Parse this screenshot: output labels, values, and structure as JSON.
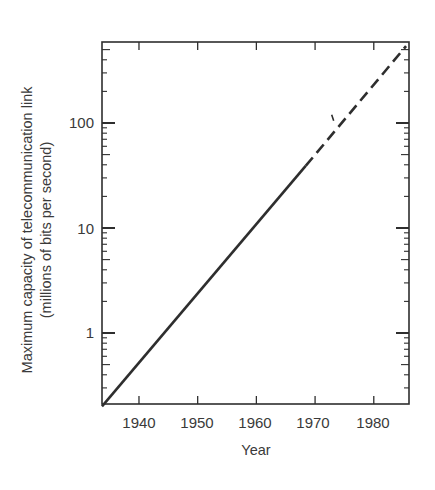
{
  "chart_data": {
    "type": "line",
    "title": "",
    "xlabel": "Year",
    "ylabel": "Maximum capacity of telecommunication link",
    "ylabel_line2": "(millions of bits per second)",
    "yscale": "log",
    "xlim": [
      1933.7,
      1986
    ],
    "ylim": [
      0.19,
      590
    ],
    "grid": false,
    "legend": null,
    "x_ticks": [
      1940,
      1950,
      1960,
      1970,
      1980
    ],
    "x_tick_labels": [
      "1940",
      "1950",
      "1960",
      "1970",
      "1980"
    ],
    "y_ticks": [
      1,
      10,
      100
    ],
    "y_tick_labels": [
      "1",
      "10",
      "100"
    ],
    "series": [
      {
        "name": "historical trend",
        "style": "solid",
        "x": [
          1933.7,
          1968.4
        ],
        "y": [
          0.2,
          39
        ]
      },
      {
        "name": "projected trend",
        "style": "dashed",
        "x": [
          1968.4,
          1985.5
        ],
        "y": [
          39,
          540
        ]
      }
    ],
    "annotations": [
      {
        "type": "mark",
        "x": 1973,
        "y": 105,
        "text": ""
      }
    ]
  },
  "labels": {
    "xlabel": "Year",
    "ylabel": "Maximum capacity of telecommunication link",
    "ylabel2": "(millions of bits per second)",
    "x_ticks": [
      "1940",
      "1950",
      "1960",
      "1970",
      "1980"
    ],
    "y_ticks": [
      "1",
      "10",
      "100"
    ]
  },
  "colors": {
    "ink": "#2e2e2e",
    "text": "#3a3a3a",
    "background": "#ffffff"
  }
}
